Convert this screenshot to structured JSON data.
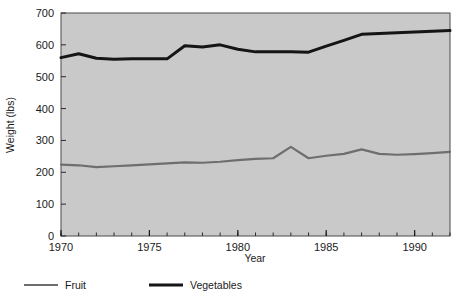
{
  "chart_data": {
    "type": "line",
    "title": "",
    "subtitle": "",
    "xlabel": "Year",
    "ylabel": "Weight (lbs)",
    "xlim": [
      1970,
      1992
    ],
    "ylim": [
      0,
      700
    ],
    "xticks": [
      1970,
      1975,
      1980,
      1985,
      1990
    ],
    "xtick_labels": [
      "1970",
      "1975",
      "1980",
      "1985",
      "1990"
    ],
    "xminor_tick_step": 1,
    "yticks": [
      0,
      100,
      200,
      300,
      400,
      500,
      600,
      700
    ],
    "ytick_labels": [
      "0",
      "100",
      "200",
      "300",
      "400",
      "500",
      "600",
      "700"
    ],
    "grid": false,
    "plot_background": "#c9c9c9",
    "legend_position": "below-left",
    "x": [
      1970,
      1971,
      1972,
      1973,
      1974,
      1975,
      1976,
      1977,
      1978,
      1979,
      1980,
      1981,
      1982,
      1983,
      1984,
      1985,
      1986,
      1987,
      1988,
      1989,
      1990,
      1991,
      1992
    ],
    "series": [
      {
        "name": "Fruit",
        "color": "#6e6e6e",
        "line_width": 2.2,
        "values": [
          224,
          222,
          216,
          219,
          222,
          225,
          228,
          231,
          230,
          233,
          238,
          242,
          244,
          280,
          244,
          252,
          258,
          272,
          258,
          255,
          257,
          260,
          264
        ]
      },
      {
        "name": "Vegetables",
        "color": "#151515",
        "line_width": 3.0,
        "values": [
          560,
          572,
          558,
          555,
          556,
          556,
          556,
          597,
          593,
          600,
          586,
          578,
          578,
          578,
          577,
          596,
          614,
          633,
          636,
          638,
          640,
          643,
          645
        ]
      }
    ],
    "legend": [
      {
        "label": "Fruit",
        "color": "#6e6e6e",
        "line_width": 2.2
      },
      {
        "label": "Vegetables",
        "color": "#151515",
        "line_width": 3.0
      }
    ]
  },
  "axes": {
    "y_title": "Weight (lbs)",
    "x_title": "Year"
  }
}
